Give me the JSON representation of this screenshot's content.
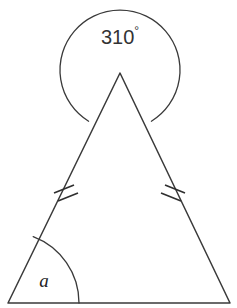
{
  "figure": {
    "background_color": "#ffffff",
    "stroke_color": "#3a3a3a",
    "width": 237,
    "height": 308
  },
  "labels": {
    "reflex_angle_value": "310",
    "degree_symbol": "°",
    "reflex_angle_full": "310°",
    "unknown_angle": "a"
  },
  "geometry": {
    "triangle": {
      "name": "isosceles-triangle",
      "apex": {
        "x": 120,
        "y": 73
      },
      "bottom_left": {
        "x": 8,
        "y": 303
      },
      "bottom_right": {
        "x": 230,
        "y": 303
      },
      "path": "M 120 73 L 8 303 L 230 303 Z"
    },
    "reflex_arc": {
      "name": "reflex-angle-arc",
      "center": {
        "x": 120,
        "y": 70
      },
      "radius": 60,
      "sweep_degrees": 310,
      "path": "M 88.6 121.2 A 60 60 0 1 1 151.4 121.2"
    },
    "angle_arc": {
      "name": "angle-a-arc",
      "vertex": {
        "x": 8,
        "y": 303
      },
      "radius": 71,
      "path": "M 33.2 236.6 A 71 71 0 0 1 79 303"
    },
    "tick_marks": {
      "name": "equal-side-ticks",
      "count_per_side": 2,
      "left": [
        {
          "x1": 54,
          "y1": 193,
          "x2": 74,
          "y2": 185
        },
        {
          "x1": 58,
          "y1": 201,
          "x2": 78,
          "y2": 193
        }
      ],
      "right": [
        {
          "x1": 165,
          "y1": 185,
          "x2": 185,
          "y2": 193
        },
        {
          "x1": 161,
          "y1": 193,
          "x2": 181,
          "y2": 201
        }
      ]
    },
    "label_positions": {
      "reflex": {
        "x": 120,
        "y": 39
      },
      "angle_a": {
        "x": 44,
        "y": 283
      }
    }
  }
}
